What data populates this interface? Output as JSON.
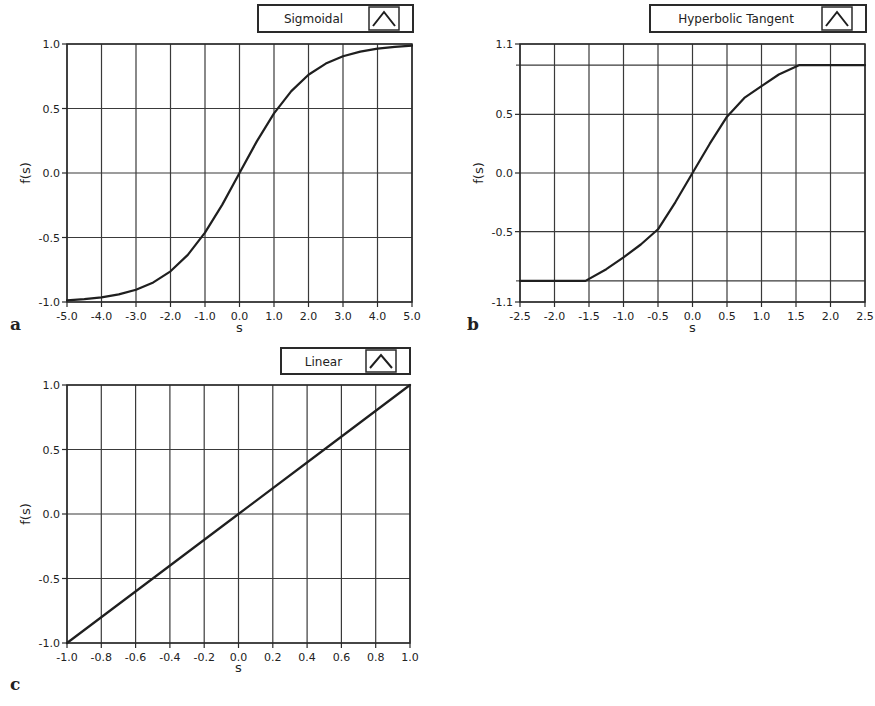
{
  "chart_data": [
    {
      "panel": "a",
      "type": "line",
      "title": "",
      "legend": [
        "Sigmoidal"
      ],
      "xlabel": "s",
      "ylabel": "f(s)",
      "xlim": [
        -5.0,
        5.0
      ],
      "ylim": [
        -1.0,
        1.0
      ],
      "x_ticks": [
        "-5.0",
        "-4.0",
        "-3.0",
        "-2.0",
        "-1.0",
        "0.0",
        "1.0",
        "2.0",
        "3.0",
        "4.0",
        "5.0"
      ],
      "y_ticks": [
        "1.0",
        "0.5",
        "0.0",
        "-0.5",
        "-1.0"
      ],
      "grid": true,
      "series": [
        {
          "name": "Sigmoidal",
          "x": [
            -5,
            -4.5,
            -4,
            -3.5,
            -3,
            -2.5,
            -2,
            -1.5,
            -1,
            -0.5,
            0,
            0.5,
            1,
            1.5,
            2,
            2.5,
            3,
            3.5,
            4,
            4.5,
            5
          ],
          "y": [
            -0.987,
            -0.978,
            -0.964,
            -0.941,
            -0.905,
            -0.848,
            -0.762,
            -0.635,
            -0.462,
            -0.245,
            0.0,
            0.245,
            0.462,
            0.635,
            0.762,
            0.848,
            0.905,
            0.941,
            0.964,
            0.978,
            0.987
          ]
        }
      ]
    },
    {
      "panel": "b",
      "type": "line",
      "title": "",
      "legend": [
        "Hyperbolic Tangent"
      ],
      "xlabel": "s",
      "ylabel": "f(s)",
      "xlim": [
        -2.5,
        2.5
      ],
      "ylim": [
        -1.1,
        1.1
      ],
      "x_ticks": [
        "-2.5",
        "-2.0",
        "-1.5",
        "-1.0",
        "-0.5",
        "0.0",
        "0.5",
        "1.0",
        "1.5",
        "2.0",
        "2.5"
      ],
      "y_ticks": [
        "1.1",
        "0.5",
        "0.0",
        "-0.5",
        "-1.1"
      ],
      "extra_hlines": [
        0.92,
        -0.92
      ],
      "grid": true,
      "series": [
        {
          "name": "Hyperbolic Tangent",
          "x": [
            -2.5,
            -2.0,
            -1.55,
            -1.25,
            -1.0,
            -0.75,
            -0.5,
            -0.25,
            0.0,
            0.25,
            0.5,
            0.75,
            1.0,
            1.25,
            1.55,
            2.0,
            2.5
          ],
          "y": [
            -0.92,
            -0.92,
            -0.92,
            -0.82,
            -0.72,
            -0.61,
            -0.48,
            -0.25,
            0.0,
            0.25,
            0.48,
            0.64,
            0.74,
            0.84,
            0.92,
            0.92,
            0.92
          ]
        }
      ]
    },
    {
      "panel": "c",
      "type": "line",
      "title": "",
      "legend": [
        "Linear"
      ],
      "xlabel": "s",
      "ylabel": "f(s)",
      "xlim": [
        -1.0,
        1.0
      ],
      "ylim": [
        -1.0,
        1.0
      ],
      "x_ticks": [
        "-1.0",
        "-0.8",
        "-0.6",
        "-0.4",
        "-0.2",
        "0.0",
        "0.2",
        "0.4",
        "0.6",
        "0.8",
        "1.0"
      ],
      "y_ticks": [
        "1.0",
        "0.5",
        "0.0",
        "-0.5",
        "-1.0"
      ],
      "grid": true,
      "series": [
        {
          "name": "Linear",
          "x": [
            -1.0,
            -0.5,
            0.0,
            0.5,
            1.0
          ],
          "y": [
            -1.0,
            -0.5,
            0.0,
            0.5,
            1.0
          ]
        }
      ]
    }
  ],
  "panels": {
    "a": {
      "letter": "a",
      "legend_label": "Sigmoidal",
      "xlabel": "s",
      "ylabel": "f(s)",
      "x_ticks": [
        "-5.0",
        "-4.0",
        "-3.0",
        "-2.0",
        "-1.0",
        "0.0",
        "1.0",
        "2.0",
        "3.0",
        "4.0",
        "5.0"
      ],
      "y_ticks": [
        "1.0",
        "0.5",
        "0.0",
        "-0.5",
        "-1.0"
      ]
    },
    "b": {
      "letter": "b",
      "legend_label": "Hyperbolic Tangent",
      "xlabel": "s",
      "ylabel": "f(s)",
      "x_ticks": [
        "-2.5",
        "-2.0",
        "-1.5",
        "-1.0",
        "-0.5",
        "0.0",
        "0.5",
        "1.0",
        "1.5",
        "2.0",
        "2.5"
      ],
      "y_ticks": [
        "1.1",
        "0.5",
        "0.0",
        "-0.5",
        "-1.1"
      ]
    },
    "c": {
      "letter": "c",
      "legend_label": "Linear",
      "xlabel": "s",
      "ylabel": "f(s)",
      "x_ticks": [
        "-1.0",
        "-0.8",
        "-0.6",
        "-0.4",
        "-0.2",
        "0.0",
        "0.2",
        "0.4",
        "0.6",
        "0.8",
        "1.0"
      ],
      "y_ticks": [
        "1.0",
        "0.5",
        "0.0",
        "-0.5",
        "-1.0"
      ]
    }
  },
  "colors": {
    "line": "#1f1f1f",
    "grid": "#3a3a3a",
    "frame": "#2a2a2a",
    "background": "#ffffff"
  }
}
